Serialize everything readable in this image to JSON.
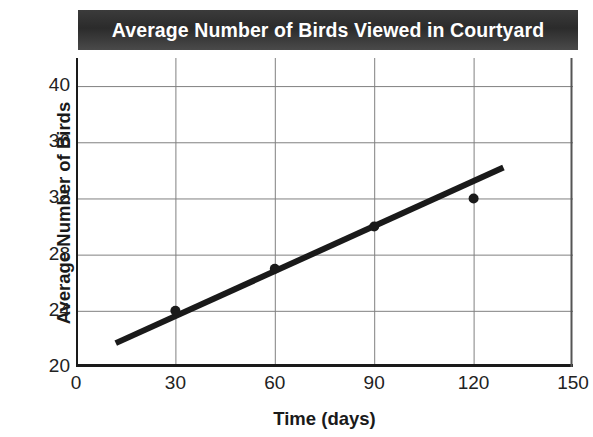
{
  "chart_data": {
    "type": "scatter",
    "title": "Average Number of Birds Viewed in Courtyard",
    "xlabel": "Time (days)",
    "ylabel": "Average Number of Birds",
    "xlim": [
      0,
      150
    ],
    "ylim": [
      20,
      42
    ],
    "x_ticks": [
      0,
      30,
      60,
      90,
      120,
      150
    ],
    "y_ticks": [
      20,
      24,
      28,
      32,
      36,
      40
    ],
    "x_tick_labels": [
      "0",
      "30",
      "60",
      "90",
      "120",
      "150"
    ],
    "y_tick_labels": [
      "20",
      "24",
      "28",
      "32",
      "36",
      "40"
    ],
    "grid": "both",
    "legend": "none",
    "series": [
      {
        "name": "Average Number of Birds Viewed",
        "type": "scatter",
        "marker": "circle",
        "color": "#1a1a1a",
        "points": [
          {
            "x": 30,
            "y": 24
          },
          {
            "x": 60,
            "y": 27
          },
          {
            "x": 90,
            "y": 30
          },
          {
            "x": 120,
            "y": 32
          }
        ]
      },
      {
        "name": "Trend line",
        "type": "line",
        "color": "#1a1a1a",
        "points": [
          {
            "x": 12,
            "y": 21.7
          },
          {
            "x": 129,
            "y": 34.2
          }
        ]
      }
    ],
    "colors": {
      "title_band": "#333333",
      "title_text": "#ffffff",
      "axis": "#1a1a1a",
      "grid": "#808080",
      "plot_background": "#ffffff",
      "data": "#1a1a1a"
    }
  }
}
